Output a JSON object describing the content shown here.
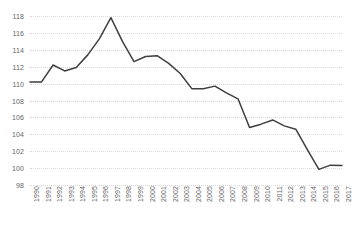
{
  "chart_data": {
    "type": "line",
    "title": "",
    "subtitle": "",
    "xlabel": "",
    "ylabel": "",
    "legend": [],
    "legend_position": "none",
    "grid": true,
    "grid_style": "dotted-horizontal",
    "ylim": [
      98,
      118
    ],
    "yticks": [
      98,
      100,
      102,
      104,
      106,
      108,
      110,
      112,
      114,
      116,
      118
    ],
    "categories": [
      "1990",
      "1991",
      "1992",
      "1993",
      "1994",
      "1995",
      "1996",
      "1997",
      "1998",
      "1999",
      "2000",
      "2001",
      "2002",
      "2003",
      "2004",
      "2005",
      "2006",
      "2007",
      "2008",
      "2009",
      "2010",
      "2011",
      "2012",
      "2013",
      "2014",
      "2015",
      "2016",
      "2017"
    ],
    "series": [
      {
        "name": "series-1",
        "color": "#3f3f3f",
        "values": [
          110.2,
          110.2,
          112.2,
          111.5,
          111.9,
          113.4,
          115.3,
          117.8,
          115.0,
          112.6,
          113.2,
          113.3,
          112.4,
          111.2,
          109.4,
          109.4,
          109.7,
          108.9,
          108.2,
          104.8,
          105.2,
          105.7,
          105.0,
          104.6,
          102.2,
          99.85,
          100.35,
          100.3
        ]
      }
    ]
  },
  "style": {
    "line_color": "#3f3f3f",
    "grid_color": "#d9d9d9",
    "tick_label_color": "#636363",
    "background": "#ffffff"
  }
}
